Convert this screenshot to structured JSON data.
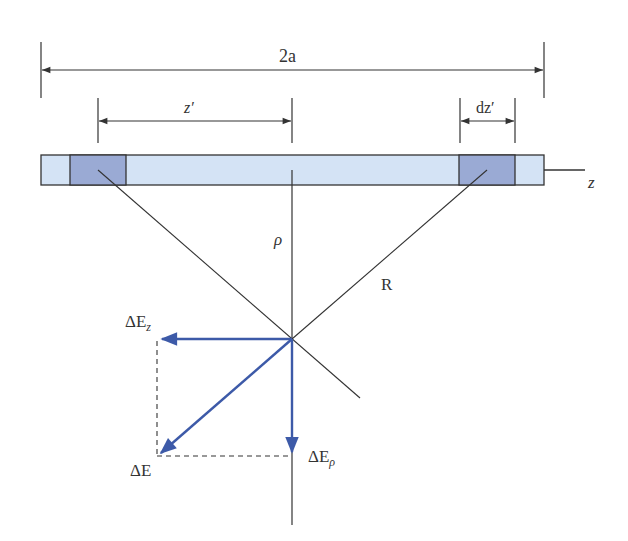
{
  "diagram": {
    "colors": {
      "bar_fill": "#d4e3f5",
      "segment_fill": "#9aaad4",
      "outline": "#333333",
      "vector": "#3d5aa8",
      "background": "#ffffff"
    },
    "labels": {
      "length": "2a",
      "z_prime": "z′",
      "dz_prime": "dz′",
      "z_axis": "z",
      "rho": "ρ",
      "R": "R",
      "delta_E_z_main": "ΔE",
      "delta_E_z_sub": "z",
      "delta_E": "ΔE",
      "delta_E_rho_main": "ΔE",
      "delta_E_rho_sub": "ρ"
    },
    "elements": {
      "line_charge": "horizontal bar along z-axis",
      "charge_elements": [
        "left segment dz′ at −z′",
        "right segment dz′ at +z′"
      ],
      "vectors": [
        "ΔE (resultant)",
        "ΔE_z (horizontal component)",
        "ΔE_ρ (vertical component)"
      ]
    }
  }
}
